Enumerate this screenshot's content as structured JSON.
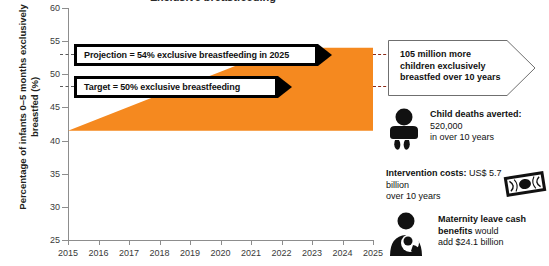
{
  "title": "Exclusive breastfeeding",
  "axes": {
    "ylabel": "Percentage of infants 0–5 months exclusively breastfed (%)",
    "yticks": [
      "60",
      "55",
      "50",
      "45",
      "40",
      "35",
      "30",
      "25"
    ],
    "xticks": [
      "2015",
      "2016",
      "2017",
      "2018",
      "2019",
      "2020",
      "2021",
      "2022",
      "2023",
      "2024",
      "2025"
    ]
  },
  "banners": {
    "projection": "Projection = 54% exclusive breastfeeding in 2025",
    "target": "Target = 50% exclusive breastfeeding"
  },
  "callout": {
    "text": "105 million more children exclusively breastfed over 10 years"
  },
  "stats": [
    {
      "icon": "baby-icon",
      "bold": "Child deaths averted:",
      "value": " 520,000",
      "suffix": "in over 10 years"
    },
    {
      "icon": "banknote-icon",
      "bold": "Intervention costs:",
      "value": " US$ 5.7 billion",
      "suffix": "over 10 years"
    },
    {
      "icon": "breastfeeding-mother-icon",
      "bold": "Maternity leave cash benefits",
      "value": " would",
      "suffix": "add $24.1 billion"
    }
  ],
  "colors": {
    "area": "#F5891F",
    "dash": "#8C2A17",
    "axis": "#8D8D8D",
    "banner": "#000000"
  },
  "chart_data": {
    "type": "area",
    "title": "Exclusive breastfeeding",
    "xlabel": "",
    "ylabel": "Percentage of infants 0–5 months exclusively breastfed (%)",
    "x": [
      2015,
      2016,
      2017,
      2018,
      2019,
      2020,
      2021,
      2022,
      2023,
      2024,
      2025
    ],
    "xlim": [
      2015,
      2025
    ],
    "ylim": [
      25,
      60
    ],
    "grid": false,
    "legend": "none",
    "series": [
      {
        "name": "Projected exclusive breastfeeding (upper bound)",
        "values": [
          41.5,
          43.3,
          45.1,
          46.9,
          48.6,
          50.4,
          52.2,
          54.0,
          54.0,
          54.0,
          54.0
        ]
      },
      {
        "name": "Baseline (lower bound)",
        "values": [
          41.5,
          41.5,
          41.5,
          41.5,
          41.5,
          41.5,
          41.5,
          41.5,
          41.5,
          41.5,
          41.5
        ]
      }
    ],
    "annotations": [
      {
        "label": "Projection = 54% exclusive breastfeeding in 2025",
        "y": 54
      },
      {
        "label": "Target = 50% exclusive breastfeeding",
        "y": 50
      }
    ]
  }
}
